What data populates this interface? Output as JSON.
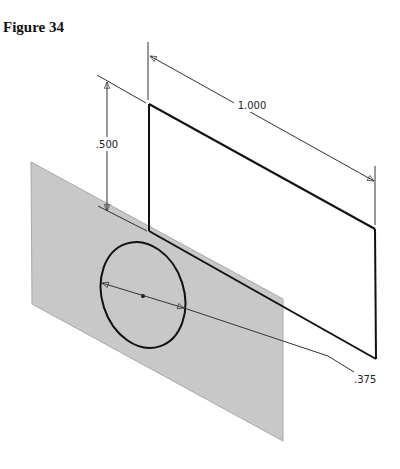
{
  "figure": {
    "title": "Figure 34"
  },
  "dimensions": {
    "width_label": "1.000",
    "height_label": ".500",
    "diameter_label": ".375"
  },
  "colors": {
    "plane_fill": "#c8c8c8",
    "plane_edge": "#a8a8a8",
    "line": "#111111",
    "dim_line": "#333333"
  },
  "diagram": {
    "elements": [
      {
        "name": "work-plane",
        "type": "parallelogram"
      },
      {
        "name": "rectangle-profile",
        "type": "parallelogram"
      },
      {
        "name": "circle-sketch",
        "type": "ellipse"
      },
      {
        "name": "dimension-width",
        "value": "1.000"
      },
      {
        "name": "dimension-height",
        "value": ".500"
      },
      {
        "name": "dimension-diameter",
        "value": ".375"
      }
    ]
  }
}
